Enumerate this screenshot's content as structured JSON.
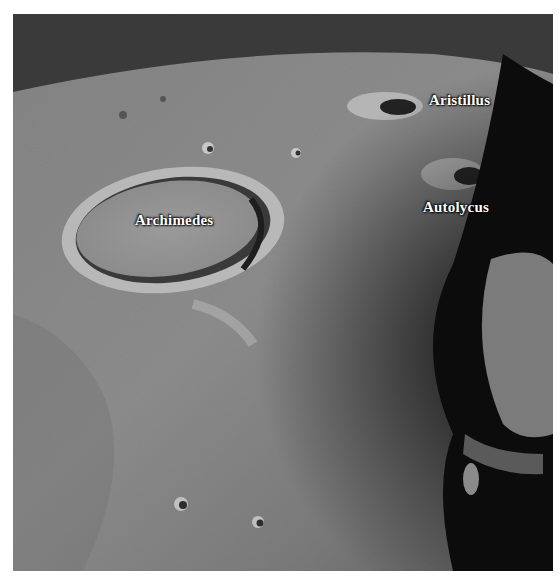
{
  "image": {
    "subject": "Oblique view of lunar surface with labeled craters",
    "colors": {
      "space": "#0a0a0a",
      "surface_light": "#a9a9a9",
      "surface_mid": "#8a8a8a",
      "surface_dark": "#5a5a5a",
      "label": "#ffffff",
      "background": "#ffffff"
    }
  },
  "labels": [
    {
      "id": "archimedes",
      "text": "Archimedes",
      "x": 135,
      "y": 211
    },
    {
      "id": "aristillus",
      "text": "Aristillus",
      "x": 428,
      "y": 92
    },
    {
      "id": "autolycus",
      "text": "Autolycus",
      "x": 422,
      "y": 198
    }
  ]
}
